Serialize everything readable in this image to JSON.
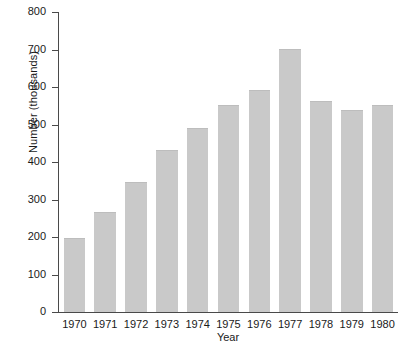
{
  "chart_data": {
    "type": "bar",
    "title": "",
    "xlabel": "Year",
    "ylabel": "Number (thousands)",
    "categories": [
      "1970",
      "1971",
      "1972",
      "1973",
      "1974",
      "1975",
      "1976",
      "1977",
      "1978",
      "1979",
      "1980"
    ],
    "values": [
      198,
      268,
      347,
      433,
      490,
      552,
      592,
      702,
      563,
      538,
      553
    ],
    "ylim": [
      0,
      800
    ],
    "ytick_values": [
      0,
      100,
      200,
      300,
      400,
      500,
      600,
      700,
      800
    ],
    "ytick_labels": [
      "0",
      "100",
      "200",
      "300",
      "400",
      "500",
      "600",
      "700",
      "800"
    ],
    "grid": false,
    "legend": null,
    "bar_color": "#c9c9c9",
    "bar_edge_color": "#bdbdbd",
    "axis_color": "#4a4a4a",
    "background": "#ffffff"
  }
}
